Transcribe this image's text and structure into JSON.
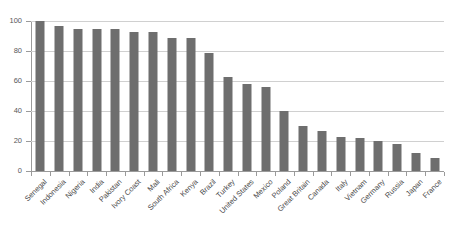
{
  "chart_data": {
    "type": "bar",
    "title": "",
    "subtitle": "",
    "xlabel": "",
    "ylabel": "",
    "ylim": [
      0,
      100
    ],
    "yticks": [
      0,
      20,
      40,
      60,
      80,
      100
    ],
    "ytick_labels": [
      "0",
      "20",
      "40",
      "60",
      "80",
      "100"
    ],
    "grid": true,
    "legend": false,
    "legend_position": "none",
    "bar_color": "#6e6e6e",
    "gridline_color": "#d0d0d0",
    "axis_color": "#9a9a9a",
    "background_color": "#ffffff",
    "categories": [
      "Senegal",
      "Indonesia",
      "Nigeria",
      "India",
      "Pakistan",
      "Ivory Coast",
      "Mali",
      "South Africa",
      "Kenya",
      "Brazil",
      "Turkey",
      "United States",
      "Mexico",
      "Poland",
      "Great Britain",
      "Canada",
      "Italy",
      "Vietnam",
      "Germany",
      "Russia",
      "Japan",
      "France"
    ],
    "values": [
      100,
      97,
      95,
      95,
      95,
      93,
      93,
      89,
      89,
      79,
      63,
      58,
      56,
      40,
      30,
      27,
      23,
      22,
      20,
      18,
      12,
      9
    ]
  }
}
